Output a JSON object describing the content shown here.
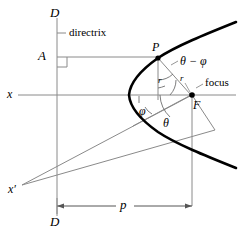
{
  "figure": {
    "colors": {
      "curve": "#000000",
      "thin_line": "#808080",
      "label": "#000000",
      "background": "#ffffff"
    },
    "labels": {
      "directrix_top": "D",
      "directrix_bottom": "D",
      "directrix_text": "directrix",
      "foot_point": "A",
      "curve_point": "P",
      "focus_point": "F",
      "focus_text": "focus",
      "axis_x": "x",
      "axis_x_prime": "x′",
      "radius": "r",
      "radius_secondary": "r",
      "angle_theta": "θ",
      "angle_phi": "φ",
      "angle_theta_minus_phi": "θ − φ",
      "distance_p": "p"
    },
    "geometry": {
      "directrix_x": 57,
      "axis_y": 95,
      "vertex_x": 129,
      "focus_x": 192,
      "focus_y": 95,
      "point_p_x": 158,
      "point_p_y": 57,
      "foot_a_x": 57,
      "foot_a_y": 57,
      "dimension_p_y": 206,
      "dimension_p_from": 57,
      "dimension_p_to": 192
    }
  }
}
